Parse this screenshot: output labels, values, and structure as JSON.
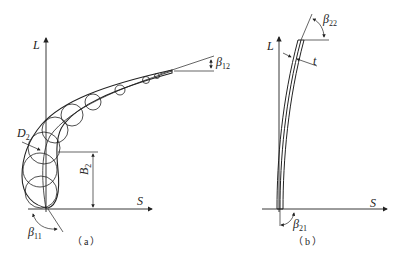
{
  "figure_a": {
    "caption": "（a）",
    "axis_y_label": "L",
    "axis_x_label": "S",
    "labels": {
      "beta12": {
        "sym": "β",
        "sub": "12"
      },
      "D2": {
        "sym": "D",
        "sub": "2"
      },
      "B2": {
        "sym": "B",
        "sub": "2"
      },
      "beta11": {
        "sym": "β",
        "sub": "11"
      }
    }
  },
  "figure_b": {
    "caption": "（b）",
    "axis_y_label": "L",
    "axis_x_label": "S",
    "labels": {
      "beta22": {
        "sym": "β",
        "sub": "22"
      },
      "t": {
        "sym": "t"
      },
      "beta21": {
        "sym": "β",
        "sub": "21"
      }
    }
  },
  "colors": {
    "line": "#222222",
    "background": "#ffffff"
  }
}
